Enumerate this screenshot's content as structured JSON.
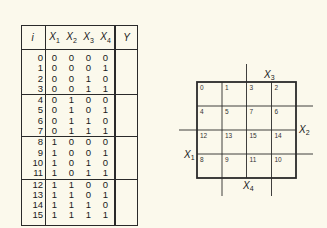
{
  "truth_table": {
    "headers": {
      "i": "i",
      "x1": "X",
      "x1_sub": "1",
      "x2": "X",
      "x2_sub": "2",
      "x3": "X",
      "x3_sub": "3",
      "x4": "X",
      "x4_sub": "4",
      "y": "Y"
    },
    "rows": [
      {
        "i": "0",
        "x1": "0",
        "x2": "0",
        "x3": "0",
        "x4": "0",
        "y": ""
      },
      {
        "i": "1",
        "x1": "0",
        "x2": "0",
        "x3": "0",
        "x4": "1",
        "y": ""
      },
      {
        "i": "2",
        "x1": "0",
        "x2": "0",
        "x3": "1",
        "x4": "0",
        "y": ""
      },
      {
        "i": "3",
        "x1": "0",
        "x2": "0",
        "x3": "1",
        "x4": "1",
        "y": ""
      },
      {
        "i": "4",
        "x1": "0",
        "x2": "1",
        "x3": "0",
        "x4": "0",
        "y": ""
      },
      {
        "i": "5",
        "x1": "0",
        "x2": "1",
        "x3": "0",
        "x4": "1",
        "y": ""
      },
      {
        "i": "6",
        "x1": "0",
        "x2": "1",
        "x3": "1",
        "x4": "0",
        "y": ""
      },
      {
        "i": "7",
        "x1": "0",
        "x2": "1",
        "x3": "1",
        "x4": "1",
        "y": ""
      },
      {
        "i": "8",
        "x1": "1",
        "x2": "0",
        "x3": "0",
        "x4": "0",
        "y": ""
      },
      {
        "i": "9",
        "x1": "1",
        "x2": "0",
        "x3": "0",
        "x4": "1",
        "y": ""
      },
      {
        "i": "10",
        "x1": "1",
        "x2": "0",
        "x3": "1",
        "x4": "0",
        "y": ""
      },
      {
        "i": "11",
        "x1": "1",
        "x2": "0",
        "x3": "1",
        "x4": "1",
        "y": ""
      },
      {
        "i": "12",
        "x1": "1",
        "x2": "1",
        "x3": "0",
        "x4": "0",
        "y": ""
      },
      {
        "i": "13",
        "x1": "1",
        "x2": "1",
        "x3": "0",
        "x4": "1",
        "y": ""
      },
      {
        "i": "14",
        "x1": "1",
        "x2": "1",
        "x3": "1",
        "x4": "0",
        "y": ""
      },
      {
        "i": "15",
        "x1": "1",
        "x2": "1",
        "x3": "1",
        "x4": "1",
        "y": ""
      }
    ]
  },
  "kmap": {
    "cells": [
      [
        "0",
        "1",
        "3",
        "2"
      ],
      [
        "4",
        "5",
        "7",
        "6"
      ],
      [
        "12",
        "13",
        "15",
        "14"
      ],
      [
        "8",
        "9",
        "11",
        "10"
      ]
    ],
    "labels": {
      "x1": "X",
      "x1_sub": "1",
      "x2": "X",
      "x2_sub": "2",
      "x3": "X",
      "x3_sub": "3",
      "x4": "X",
      "x4_sub": "4"
    }
  },
  "colors": {
    "background": "#fbf9ec",
    "ink": "#1a1a1a"
  }
}
